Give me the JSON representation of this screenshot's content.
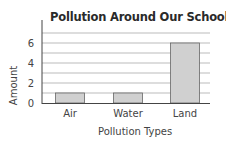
{
  "chart_data": {
    "type": "bar",
    "title": "Pollution Around Our School",
    "xlabel": "Pollution Types",
    "ylabel": "Amount",
    "categories": [
      "Air",
      "Water",
      "Land"
    ],
    "values": [
      1,
      1,
      6
    ],
    "ylim": [
      0,
      7
    ],
    "yticks": [
      0,
      2,
      4,
      6
    ],
    "grid": true,
    "bar_color": "#d0d0d0"
  }
}
